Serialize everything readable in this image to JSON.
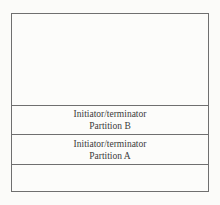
{
  "diagram": {
    "colors": {
      "page_background": "#fbfbf9",
      "box_background": "#fcfcfa",
      "line_color": "#6f6f6f",
      "text_color": "#3b3b3b"
    },
    "box": {
      "sections": [
        {
          "id": "top-empty",
          "line1": "",
          "line2": ""
        },
        {
          "id": "partition-b",
          "line1": "Initiator/terminator",
          "line2": "Partition B"
        },
        {
          "id": "partition-a",
          "line1": "Initiator/terminator",
          "line2": "Partition A"
        },
        {
          "id": "bottom-empty",
          "line1": "",
          "line2": ""
        }
      ]
    }
  }
}
